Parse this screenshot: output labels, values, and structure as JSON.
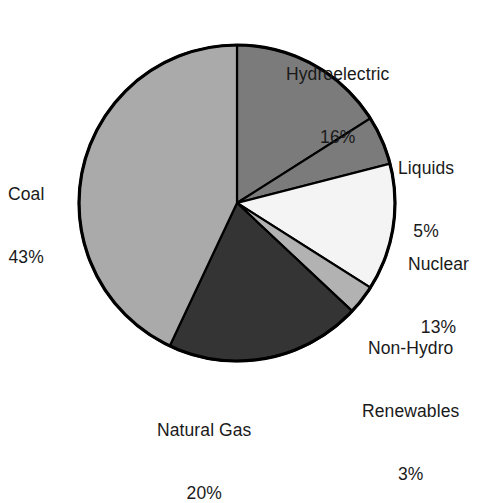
{
  "chart_data": {
    "type": "pie",
    "title": "",
    "subtitle": "",
    "xlabel": "",
    "ylabel": "",
    "legend_position": "none",
    "grid": false,
    "labels_outside": true,
    "start_angle_deg": 0,
    "direction": "clockwise",
    "categories": [
      "Hydroelectric",
      "Liquids",
      "Nuclear",
      "Non-Hydro Renewables",
      "Natural Gas",
      "Coal"
    ],
    "values": [
      16,
      5,
      13,
      3,
      20,
      43
    ],
    "units": "percent",
    "total": 100,
    "slices": [
      {
        "name": "Hydroelectric",
        "value": 16,
        "value_text": "16%",
        "label_lines": [
          "Hydroelectric",
          "16%"
        ],
        "color": "#7b7b7b",
        "start_deg": 0,
        "end_deg": 57.6
      },
      {
        "name": "Liquids",
        "value": 5,
        "value_text": "5%",
        "label_lines": [
          "Liquids",
          "5%"
        ],
        "color": "#7b7b7b",
        "start_deg": 57.6,
        "end_deg": 75.6
      },
      {
        "name": "Nuclear",
        "value": 13,
        "value_text": "13%",
        "label_lines": [
          "Nuclear",
          "13%"
        ],
        "color": "#f4f4f4",
        "start_deg": 75.6,
        "end_deg": 122.4
      },
      {
        "name": "Non-Hydro Renewables",
        "value": 3,
        "value_text": "3%",
        "label_lines": [
          "Non-Hydro",
          "Renewables",
          "3%"
        ],
        "color": "#b2b2b2",
        "start_deg": 122.4,
        "end_deg": 133.2
      },
      {
        "name": "Natural Gas",
        "value": 20,
        "value_text": "20%",
        "label_lines": [
          "Natural Gas",
          "20%"
        ],
        "color": "#343434",
        "start_deg": 133.2,
        "end_deg": 205.2
      },
      {
        "name": "Coal",
        "value": 43,
        "value_text": "43%",
        "label_lines": [
          "Coal",
          "43%"
        ],
        "color": "#aaaaaa",
        "start_deg": 205.2,
        "end_deg": 360
      }
    ],
    "geometry": {
      "center_x": 237,
      "center_y": 203,
      "radius": 158
    },
    "colors": {
      "outline": "#000000",
      "background": "#ffffff",
      "text": "#1a1a1a"
    }
  },
  "labels": {
    "hydroelectric": {
      "l1": "Hydroelectric",
      "l2": "16%"
    },
    "liquids": {
      "l1": "Liquids",
      "l2": "5%"
    },
    "nuclear": {
      "l1": "Nuclear",
      "l2": "13%"
    },
    "nonhydro": {
      "l1": "Non-Hydro",
      "l2": "Renewables",
      "l3": "3%"
    },
    "naturalgas": {
      "l1": "Natural Gas",
      "l2": "20%"
    },
    "coal": {
      "l1": "Coal",
      "l2": "43%"
    }
  }
}
